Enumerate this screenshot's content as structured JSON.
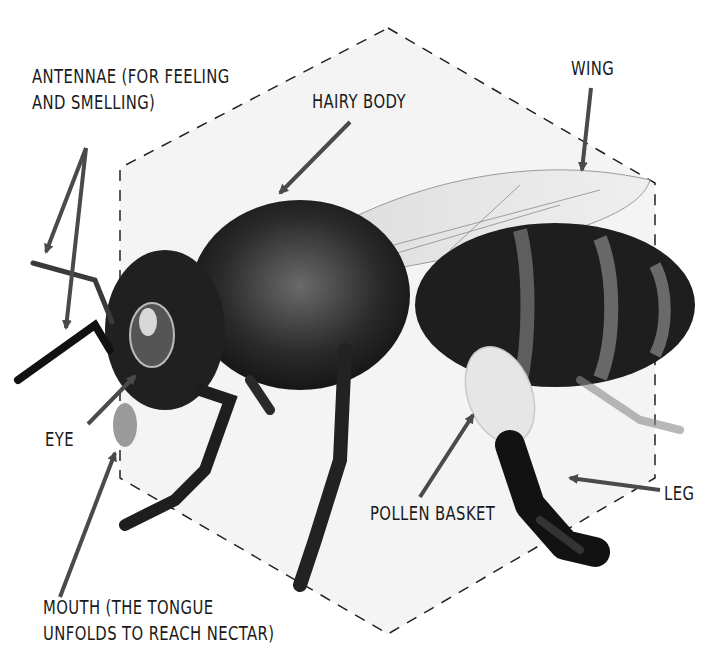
{
  "diagram": {
    "colors": {
      "background": "#ffffff",
      "hexagon_fill": "#f4f4f4",
      "hexagon_stroke": "#222222",
      "arrow": "#4a4a4a",
      "text": "#1a1a1a",
      "body_dark": "#1c1c1c",
      "pollen": "#e6e6e6"
    },
    "labels": {
      "antennae": {
        "line1": "ANTENNAE (FOR FEELING",
        "line2": "AND SMELLING)"
      },
      "hairy_body": {
        "line1": "HAIRY BODY"
      },
      "wing": {
        "line1": "WING"
      },
      "eye": {
        "line1": "EYE"
      },
      "pollen_basket": {
        "line1": "POLLEN BASKET"
      },
      "leg": {
        "line1": "LEG"
      },
      "mouth": {
        "line1": "MOUTH (THE TONGUE",
        "line2": "UNFOLDS TO REACH NECTAR)"
      }
    }
  }
}
